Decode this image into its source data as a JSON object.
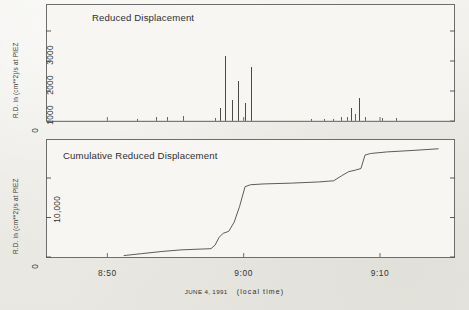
{
  "figure": {
    "background_color": "#efeeea",
    "ink_color": "#4a4a4a",
    "xaxis": {
      "ticks": [
        "8:50",
        "9:00",
        "9:10"
      ],
      "tick_times_min": [
        50,
        60,
        70
      ],
      "range_min": [
        45.5,
        75.5
      ],
      "caption_date": "JUNE 4, 1991",
      "caption_tz": "(local time)"
    }
  },
  "panels": {
    "top": {
      "title": "Reduced Displacement",
      "ylabel": "R.D. in (cm**2)/s at PIEZ",
      "yticks": [
        "0",
        "1000",
        "2000",
        "3000"
      ]
    },
    "bottom": {
      "title": "Cumulative Reduced Displacement",
      "ylabel": "R.D. in (cm**2)/s at PIEZ",
      "yticks": [
        "0",
        "10,000"
      ]
    }
  },
  "chart_data": [
    {
      "type": "bar",
      "title": "Reduced Displacement",
      "xlabel": "JUNE 4, 1991 (local time)",
      "ylabel": "R.D. in (cm**2)/s at PIEZ",
      "xlim": [
        45.5,
        75.5
      ],
      "ylim": [
        0,
        3400
      ],
      "xtick_labels": [
        "8:50",
        "9:00",
        "9:10"
      ],
      "xtick_values": [
        50,
        60,
        70
      ],
      "ytick_labels": [
        "0",
        "1000",
        "2000",
        "3000"
      ],
      "ytick_values": [
        0,
        1000,
        2000,
        3000
      ],
      "grid": false,
      "legend": null,
      "x": [
        52.2,
        53.6,
        54.4,
        55.6,
        57.9,
        58.3,
        58.7,
        59.2,
        59.6,
        60.1,
        60.6,
        65.0,
        65.9,
        66.6,
        67.2,
        67.6,
        67.9,
        68.2,
        68.5,
        68.9,
        70.2,
        71.2
      ],
      "values": [
        60,
        140,
        150,
        170,
        90,
        450,
        2180,
        700,
        1350,
        600,
        1800,
        60,
        70,
        80,
        120,
        150,
        430,
        250,
        760,
        130,
        90,
        90
      ]
    },
    {
      "type": "line",
      "title": "Cumulative Reduced Displacement",
      "xlabel": "JUNE 4, 1991 (local time)",
      "ylabel": "R.D. in (cm**2)/s at PIEZ",
      "xlim": [
        45.5,
        75.5
      ],
      "ylim": [
        0,
        14500
      ],
      "xtick_labels": [
        "8:50",
        "9:00",
        "9:10"
      ],
      "xtick_values": [
        50,
        60,
        70
      ],
      "ytick_labels": [
        "0",
        "10,000"
      ],
      "ytick_values": [
        0,
        10000
      ],
      "grid": false,
      "legend": null,
      "x": [
        51.2,
        52.5,
        54.0,
        55.4,
        56.8,
        57.6,
        57.9,
        58.2,
        58.5,
        58.9,
        59.3,
        59.7,
        60.1,
        60.5,
        61.5,
        63.5,
        65.5,
        66.6,
        67.2,
        67.7,
        68.2,
        68.6,
        68.9,
        69.3,
        70.5,
        72.5,
        74.3
      ],
      "values": [
        180,
        420,
        700,
        900,
        1000,
        1050,
        1500,
        2500,
        3000,
        3250,
        4400,
        6400,
        8900,
        9150,
        9250,
        9350,
        9500,
        9650,
        10300,
        10800,
        11000,
        11200,
        12900,
        13100,
        13300,
        13500,
        13700
      ]
    }
  ]
}
